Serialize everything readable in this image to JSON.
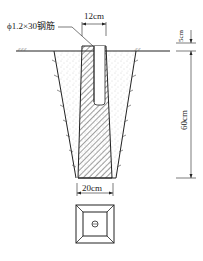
{
  "diagram": {
    "type": "construction-section",
    "labels": {
      "rebar": "ϕ1.2×30钢筋",
      "top_width": "12cm",
      "depth_top": "5cm",
      "depth_main": "60cm",
      "bottom_width": "20cm"
    },
    "caption": "",
    "colors": {
      "line": "#222222",
      "hatch": "#444444",
      "fill_sand": "#f4f4f4"
    }
  }
}
